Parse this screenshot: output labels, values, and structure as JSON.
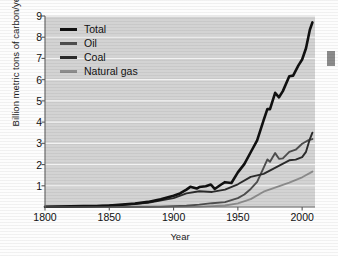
{
  "chart_data": {
    "type": "line",
    "title": "",
    "xlabel": "Year",
    "ylabel": "Billion metric tons of carbon/year",
    "xlim": [
      1800,
      2010
    ],
    "ylim": [
      0,
      9
    ],
    "xticks": [
      1800,
      1850,
      1900,
      1950,
      2000
    ],
    "yticks": [
      1,
      2,
      3,
      4,
      5,
      6,
      7,
      8,
      9
    ],
    "grid": "horizontal-white",
    "legend_position": "upper-left-inside",
    "plot_background": "#d3d3d3",
    "series": [
      {
        "name": "Total",
        "color": "#111111",
        "x": [
          1800,
          1810,
          1820,
          1830,
          1840,
          1850,
          1860,
          1870,
          1880,
          1890,
          1900,
          1905,
          1910,
          1913,
          1918,
          1920,
          1925,
          1929,
          1932,
          1937,
          1940,
          1945,
          1950,
          1955,
          1960,
          1965,
          1970,
          1973,
          1975,
          1979,
          1982,
          1985,
          1990,
          1993,
          1997,
          2000,
          2003,
          2006,
          2008
        ],
        "values": [
          0.01,
          0.02,
          0.03,
          0.04,
          0.05,
          0.07,
          0.11,
          0.16,
          0.24,
          0.36,
          0.53,
          0.64,
          0.82,
          0.95,
          0.87,
          0.94,
          0.98,
          1.06,
          0.85,
          1.06,
          1.17,
          1.13,
          1.63,
          2.02,
          2.58,
          3.14,
          4.08,
          4.62,
          4.61,
          5.38,
          5.17,
          5.46,
          6.16,
          6.19,
          6.66,
          6.95,
          7.48,
          8.35,
          8.7
        ]
      },
      {
        "name": "Oil",
        "color": "#4e4e4e",
        "x": [
          1800,
          1860,
          1870,
          1880,
          1890,
          1900,
          1910,
          1920,
          1930,
          1940,
          1950,
          1955,
          1960,
          1965,
          1970,
          1973,
          1975,
          1979,
          1982,
          1985,
          1990,
          1995,
          2000,
          2005,
          2008
        ],
        "values": [
          0.0,
          0.0,
          0.01,
          0.01,
          0.02,
          0.04,
          0.06,
          0.11,
          0.18,
          0.23,
          0.42,
          0.59,
          0.85,
          1.18,
          1.84,
          2.24,
          2.13,
          2.54,
          2.27,
          2.29,
          2.6,
          2.7,
          2.98,
          3.15,
          3.2
        ]
      },
      {
        "name": "Coal",
        "color": "#2b2b2b",
        "x": [
          1800,
          1820,
          1840,
          1860,
          1880,
          1900,
          1910,
          1920,
          1930,
          1940,
          1950,
          1960,
          1970,
          1980,
          1990,
          1995,
          2000,
          2003,
          2006,
          2008
        ],
        "values": [
          0.01,
          0.02,
          0.05,
          0.1,
          0.2,
          0.42,
          0.64,
          0.74,
          0.71,
          0.82,
          1.07,
          1.42,
          1.56,
          1.88,
          2.2,
          2.23,
          2.35,
          2.6,
          3.2,
          3.5
        ]
      },
      {
        "name": "Natural gas",
        "color": "#8c8c8c",
        "x": [
          1800,
          1880,
          1900,
          1920,
          1930,
          1940,
          1950,
          1960,
          1970,
          1980,
          1990,
          2000,
          2008
        ],
        "values": [
          0.0,
          0.0,
          0.01,
          0.02,
          0.04,
          0.07,
          0.17,
          0.37,
          0.72,
          0.94,
          1.15,
          1.4,
          1.67
        ]
      }
    ]
  },
  "axes": {
    "y_title": "Billion metric tons of carbon/year",
    "x_title": "Year",
    "x_tick_labels": [
      "1800",
      "1850",
      "1900",
      "1950",
      "2000"
    ],
    "y_tick_labels": [
      "1",
      "2",
      "3",
      "4",
      "5",
      "6",
      "7",
      "8",
      "9"
    ]
  },
  "legend": {
    "items": [
      {
        "label": "Total",
        "color": "#111111"
      },
      {
        "label": "Oil",
        "color": "#4e4e4e"
      },
      {
        "label": "Coal",
        "color": "#2b2b2b"
      },
      {
        "label": "Natural gas",
        "color": "#8c8c8c"
      }
    ]
  }
}
